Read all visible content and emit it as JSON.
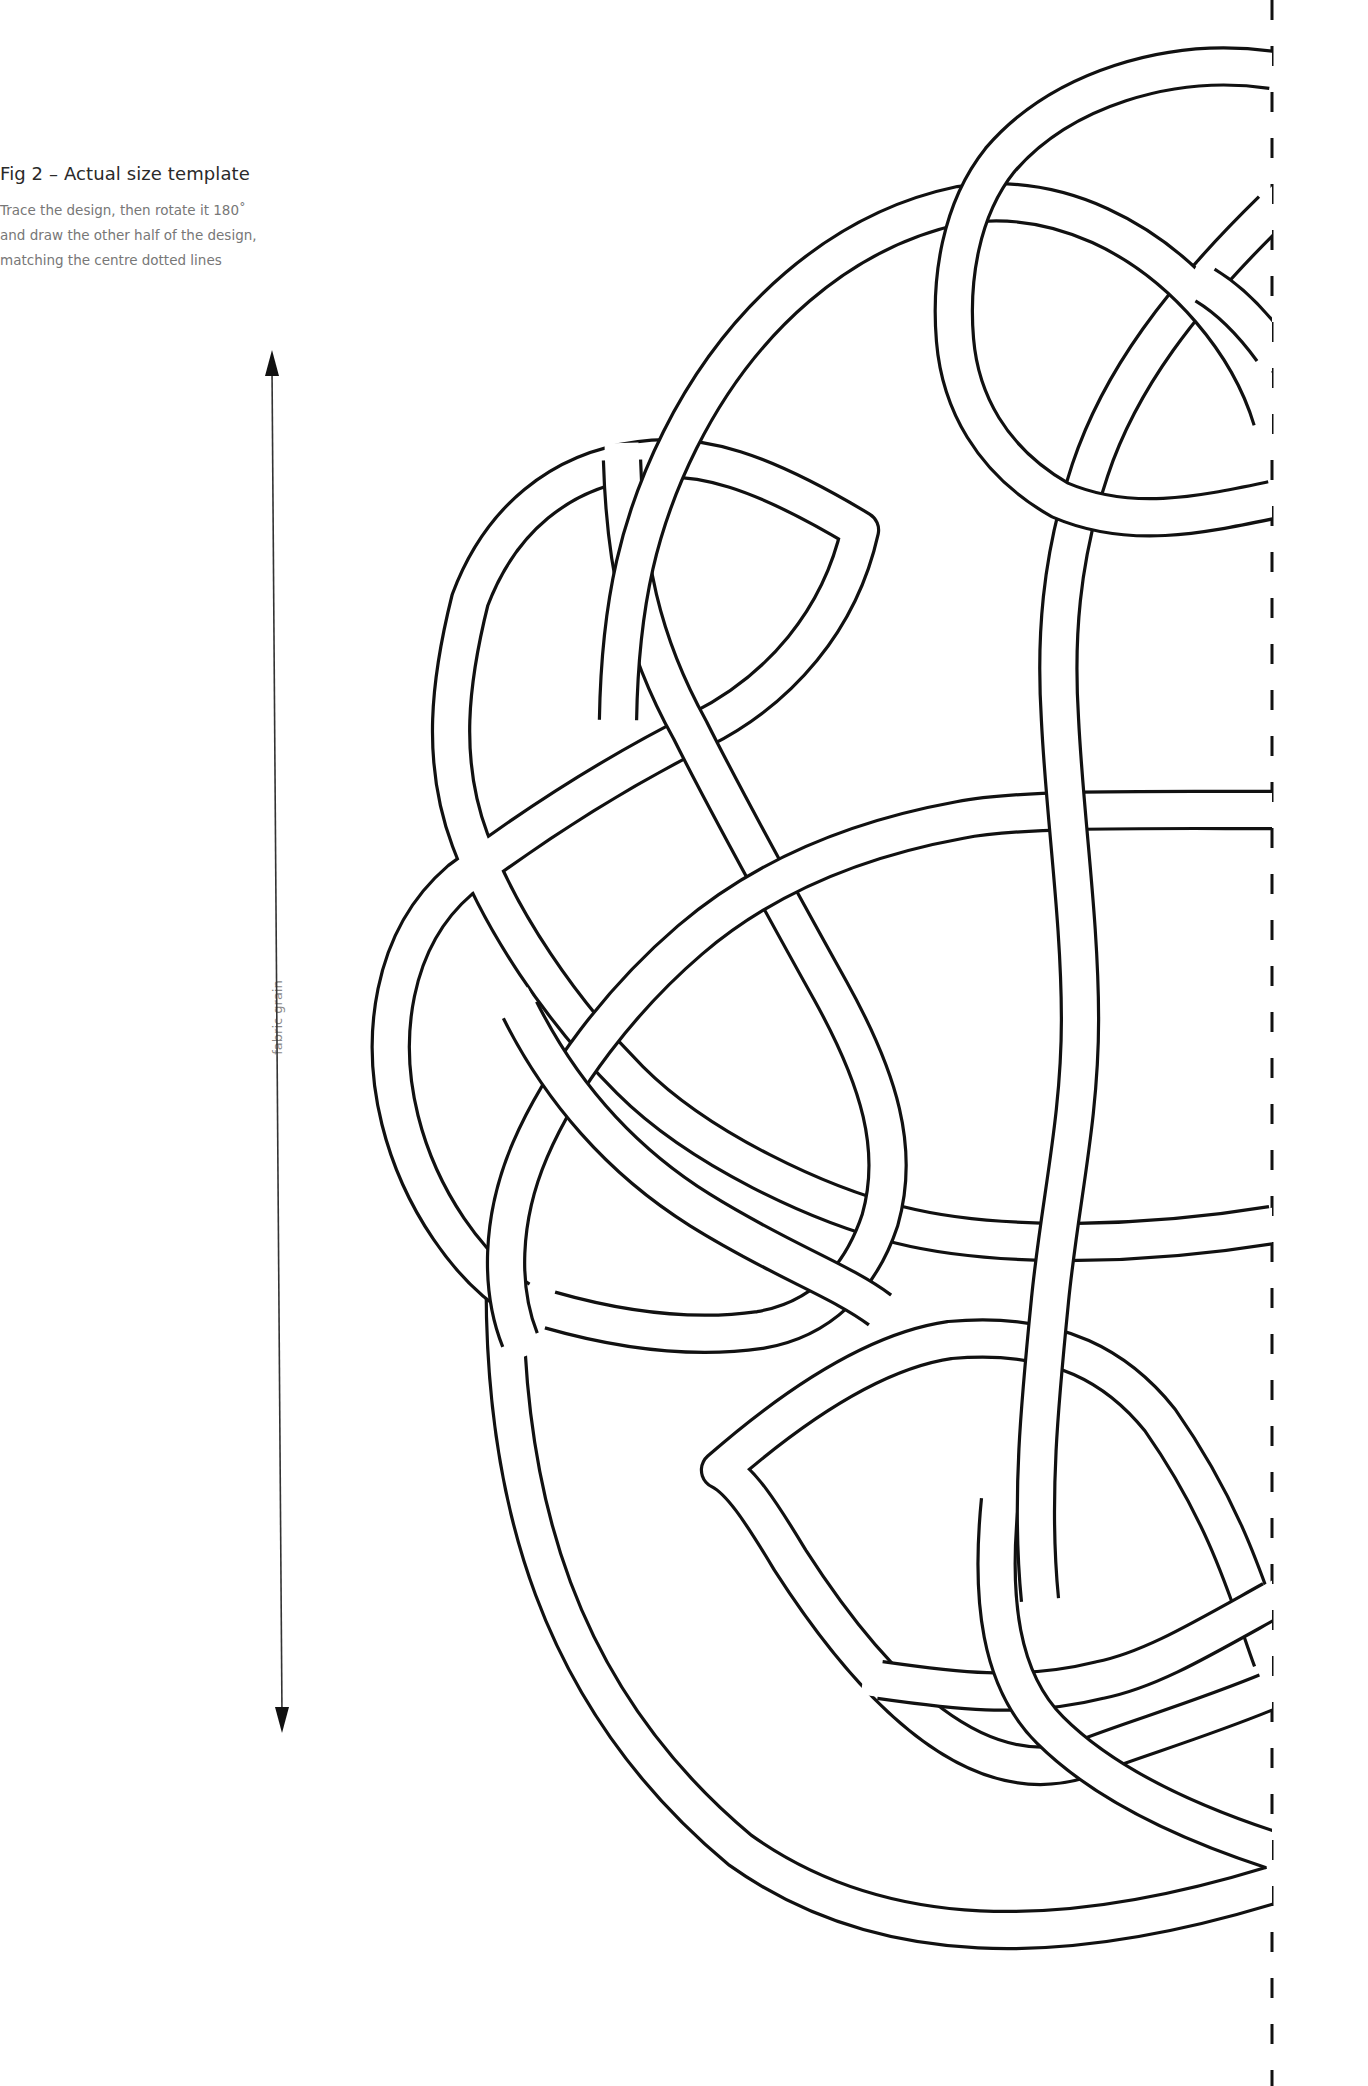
{
  "figure": {
    "title": "Fig 2 – Actual size template",
    "instructions": [
      "Trace the design, then rotate it 180˚",
      "and draw the other half of the design,",
      "matching the centre dotted lines"
    ]
  },
  "grain_arrow": {
    "label": "fabric grain",
    "top": [
      272,
      350
    ],
    "bottom": [
      282,
      1733
    ],
    "color": "#333333"
  },
  "centre_line": {
    "x": 1272,
    "y_start": 0,
    "y_end": 2086,
    "dash": "20 26",
    "color": "#111111"
  },
  "knot": {
    "band_width": 34,
    "line_width": 3.2,
    "line_color": "#111111",
    "fill_color": "#ffffff",
    "strands": [
      {
        "name": "lower-sweep",
        "d": "M 505 1260 C 500 1500 560 1700 740 1850 C 880 1950 1060 1950 1272 1885"
      },
      {
        "name": "lower-lobe",
        "d": "M 1272 1690 C 1200 1720 1130 1740 1080 1760 C 980 1790 880 1700 790 1560 C 760 1510 740 1480 720 1470 C 800 1400 880 1350 950 1340 C 1060 1330 1120 1370 1160 1420 C 1230 1520 1250 1600 1272 1660"
      },
      {
        "name": "lower-cross",
        "d": "M 1272 1600 C 1200 1640 1150 1670 1100 1680 C 1020 1700 950 1690 880 1680"
      },
      {
        "name": "lower-diag",
        "d": "M 1272 1850 C 1180 1820 1100 1780 1050 1730 C 1000 1680 990 1600 1000 1500"
      },
      {
        "name": "left-loop",
        "d": "M 1272 1225 C 1150 1245 1000 1250 900 1225 C 820 1205 700 1150 630 1080 C 560 1010 500 920 470 840 C 440 760 450 680 470 600 C 500 520 560 470 640 460 C 700 452 760 470 860 530 C 840 620 780 690 700 730 C 620 770 540 820 460 880 C 390 940 380 1040 400 1120 C 420 1200 470 1270 520 1300"
      },
      {
        "name": "inner-s",
        "d": "M 622 460 C 625 560 640 640 690 730 C 730 810 780 900 830 990 C 880 1080 900 1150 880 1220 C 860 1280 820 1320 760 1330 C 690 1340 620 1330 550 1310"
      },
      {
        "name": "centre-oval",
        "d": "M 1272 810 C 1150 810 1020 808 960 820 C 850 840 760 880 690 940 C 620 1000 560 1080 530 1150 C 500 1220 500 1290 520 1340"
      },
      {
        "name": "left-oval-lower",
        "d": "M 520 1010 C 560 1090 620 1160 700 1210 C 780 1260 840 1280 880 1310"
      },
      {
        "name": "right-vertical",
        "d": "M 1272 210 C 1180 300 1120 380 1090 470 C 1060 560 1055 640 1060 720 C 1065 820 1080 920 1080 1020 C 1080 1120 1060 1200 1050 1300 C 1040 1400 1030 1500 1040 1600"
      },
      {
        "name": "big-arc",
        "d": "M 618 720 C 620 600 640 520 680 440 C 740 320 840 230 960 205 C 1060 190 1150 240 1210 310 C 1240 345 1260 380 1272 420"
      },
      {
        "name": "top-arc",
        "d": "M 1272 70 C 1170 55 1060 90 1000 160 C 960 210 950 280 955 340 C 960 400 990 460 1060 500 C 1130 530 1200 515 1272 500"
      },
      {
        "name": "top-right-cross",
        "d": "M 1272 350 C 1250 320 1230 300 1205 285"
      }
    ]
  }
}
